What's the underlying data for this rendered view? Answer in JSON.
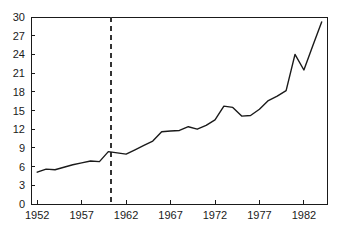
{
  "chart_data": {
    "type": "line",
    "title": "",
    "subtitle": "",
    "xlabel": "",
    "ylabel": "",
    "xlim": [
      1951.3,
      1984.6
    ],
    "ylim": [
      0,
      30
    ],
    "grid": false,
    "legend": null,
    "x_ticks": [
      1952,
      1957,
      1962,
      1967,
      1972,
      1977,
      1982
    ],
    "x_tick_labels": [
      "1952",
      "1957",
      "1962",
      "1967",
      "1972",
      "1977",
      "1982"
    ],
    "y_ticks": [
      0,
      3,
      6,
      9,
      12,
      15,
      18,
      21,
      24,
      27,
      30
    ],
    "y_tick_labels": [
      "0",
      "3",
      "6",
      "9",
      "12",
      "15",
      "18",
      "21",
      "24",
      "27",
      "30"
    ],
    "annotations": [
      {
        "name": "vertical-reference-line",
        "type": "vline",
        "x": 1960.3,
        "style": "dashed",
        "color": "#333333"
      }
    ],
    "series": [
      {
        "name": "series-1",
        "color": "#1a1a1a",
        "x": [
          1952,
          1953,
          1954,
          1955,
          1956,
          1957,
          1958,
          1959,
          1960,
          1961,
          1962,
          1963,
          1964,
          1965,
          1966,
          1967,
          1968,
          1969,
          1970,
          1971,
          1972,
          1973,
          1974,
          1975,
          1976,
          1977,
          1978,
          1979,
          1980,
          1981,
          1982,
          1983,
          1984
        ],
        "values": [
          5.1,
          5.6,
          5.5,
          5.9,
          6.3,
          6.6,
          6.9,
          6.8,
          8.4,
          8.2,
          8.0,
          8.7,
          9.4,
          10.1,
          11.6,
          11.7,
          11.8,
          12.4,
          12.0,
          12.6,
          13.5,
          15.7,
          15.5,
          14.1,
          14.2,
          15.2,
          16.6,
          17.3,
          18.2,
          24.0,
          21.5,
          25.4,
          29.2
        ]
      }
    ]
  },
  "plot_geometry": {
    "left_px": 31,
    "right_px": 327,
    "top_px": 17,
    "bottom_px": 204
  }
}
